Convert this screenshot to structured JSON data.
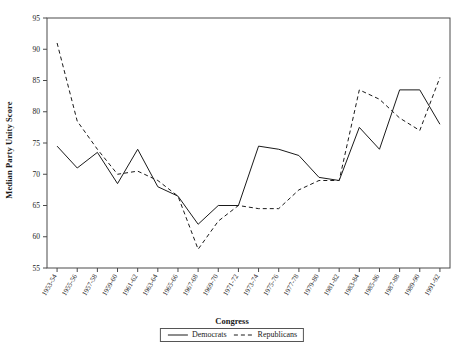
{
  "chart_data": {
    "type": "line",
    "title": "",
    "xlabel": "Congress",
    "ylabel": "Median Party Unity Score",
    "ylim": [
      55,
      95
    ],
    "ytick_step": 5,
    "yticks": [
      55,
      60,
      65,
      70,
      75,
      80,
      85,
      90,
      95
    ],
    "grid": false,
    "legend_position": "bottom-center",
    "categories": [
      "1953-54",
      "1955-56",
      "1957-58",
      "1959-60",
      "1961-62",
      "1963-64",
      "1965-66",
      "1967-68",
      "1969-70",
      "1971-72",
      "1973-74",
      "1975-76",
      "1977-78",
      "1979-80",
      "1981-82",
      "1983-84",
      "1985-86",
      "1987-88",
      "1989-90",
      "1991-92"
    ],
    "series": [
      {
        "name": "Democrats",
        "style": "solid",
        "color": "#1a1a1a",
        "values": [
          74.5,
          71.0,
          73.5,
          68.5,
          74.0,
          68.0,
          66.5,
          62.0,
          65.0,
          65.0,
          74.5,
          74.0,
          73.0,
          69.5,
          69.0,
          77.5,
          74.0,
          83.5,
          83.5,
          78.0
        ]
      },
      {
        "name": "Republicans",
        "style": "dashed",
        "color": "#1a1a1a",
        "values": [
          91.0,
          78.5,
          74.0,
          70.0,
          70.5,
          69.0,
          66.5,
          58.0,
          62.5,
          65.0,
          64.5,
          64.5,
          67.5,
          69.0,
          69.0,
          83.5,
          82.0,
          79.0,
          77.0,
          85.5
        ]
      }
    ]
  },
  "axis": {
    "ylabel_text": "Median Party Unity Score",
    "xlabel_text": "Congress"
  },
  "legend": {
    "items": [
      {
        "label": "Democrats",
        "style": "solid"
      },
      {
        "label": "Republicans",
        "style": "dashed"
      }
    ]
  }
}
